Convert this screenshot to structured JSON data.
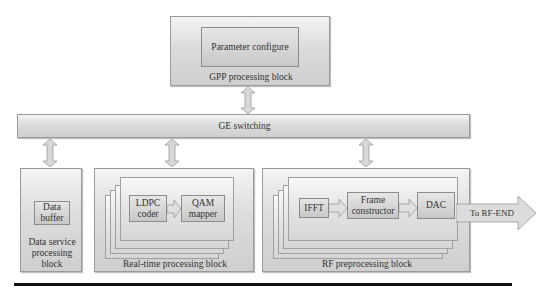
{
  "gpp_block": {
    "label": "GPP processing block",
    "inner": "Parameter configure"
  },
  "ge_bar": {
    "label": "GE switching"
  },
  "data_service_block": {
    "label_lines": [
      "Data service",
      "processing",
      "block"
    ],
    "label": "Data service processing block",
    "inner": {
      "line1": "Data",
      "line2": "buffer"
    }
  },
  "realtime_block": {
    "label": "Real-time processing block",
    "modules": [
      {
        "line1": "LDPC",
        "line2": "coder"
      },
      {
        "line1": "QAM",
        "line2": "mapper"
      }
    ]
  },
  "rf_block": {
    "label": "RF preprocessing block",
    "modules": [
      {
        "line1": "IFFT",
        "line2": ""
      },
      {
        "line1": "Frame",
        "line2": "constructor"
      },
      {
        "line1": "DAC",
        "line2": ""
      }
    ],
    "output_arrow": "To RF-END"
  },
  "colors": {
    "box_fill_top": "#f4f4f4",
    "box_fill_bottom": "#cfcfcf",
    "border": "#9a9a9a",
    "rule": "#111111"
  }
}
